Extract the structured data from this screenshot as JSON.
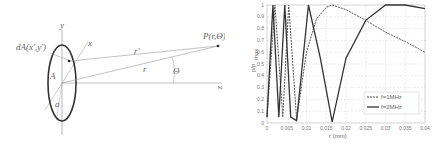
{
  "diagram": {
    "labels": {
      "y_axis": "y",
      "x_axis": "x",
      "z_axis": "z",
      "area_element": "dA(x',y')",
      "aperture": "A",
      "radius": "a",
      "r_prime": "r'",
      "r": "r",
      "theta": "Θ",
      "point": "P(r,Θ)"
    }
  },
  "chart_data": {
    "type": "line",
    "title": "",
    "xlabel": "r (mm)",
    "ylabel": "p/p_max",
    "ylabel_main": "p/p",
    "ylabel_sub": "max",
    "xlim": [
      0,
      0.04
    ],
    "ylim": [
      0,
      1
    ],
    "grid": true,
    "legend_position": "lower right",
    "x_ticks": [
      "0",
      "0.005",
      "0.01",
      "0.015",
      "0.02",
      "0.025",
      "0.03",
      "0.035",
      "0.04"
    ],
    "y_ticks": [
      "0",
      "0.1",
      "0.2",
      "0.3",
      "0.4",
      "0.5",
      "0.6",
      "0.7",
      "0.8",
      "0.9",
      "1"
    ],
    "series": [
      {
        "name": "f=1MHz",
        "style": "dashed",
        "x": [
          0,
          0.002,
          0.004,
          0.0055,
          0.0075,
          0.01,
          0.0125,
          0.015,
          0.0165,
          0.02,
          0.025,
          0.03,
          0.035,
          0.04
        ],
        "y": [
          0.05,
          1,
          0.05,
          1,
          0.03,
          0.6,
          0.88,
          0.98,
          1,
          0.96,
          0.87,
          0.77,
          0.69,
          0.6
        ]
      },
      {
        "name": "f=2MHz",
        "style": "solid",
        "x": [
          0,
          0.0015,
          0.003,
          0.0045,
          0.006,
          0.0075,
          0.0105,
          0.0135,
          0.0165,
          0.02,
          0.025,
          0.03,
          0.035,
          0.04
        ],
        "y": [
          0.05,
          1,
          0.05,
          1,
          0.05,
          0.02,
          1,
          0.55,
          0.01,
          0.55,
          0.87,
          1,
          1,
          0.97
        ]
      }
    ]
  }
}
